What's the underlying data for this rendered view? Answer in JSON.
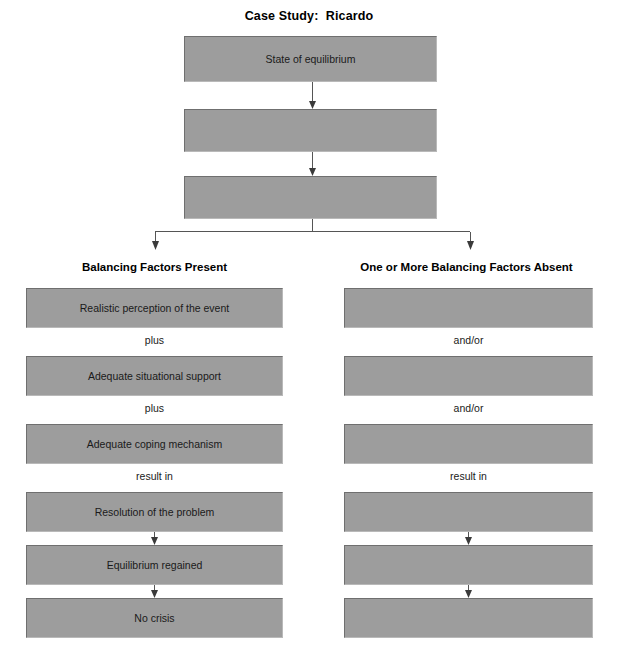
{
  "title": "Case Study:  Ricardo",
  "colors": {
    "box_fill": "#9d9d9d",
    "box_border_dark": "#6f6f6f",
    "box_border_light": "#b9b9b9",
    "line": "#555555",
    "arrow": "#3a3a3a",
    "text": "#1a1a1a",
    "background": "#ffffff"
  },
  "stem": {
    "boxes": [
      {
        "label": "State of equilibrium",
        "blank": false
      },
      {
        "label": "",
        "blank": true
      },
      {
        "label": "",
        "blank": true
      }
    ]
  },
  "columns": [
    {
      "id": "balancing-factors-present",
      "header": "Balancing Factors Present",
      "boxes": [
        {
          "label": "Realistic perception of the event",
          "blank": false
        },
        {
          "label": "Adequate situational support",
          "blank": false
        },
        {
          "label": "Adequate coping mechanism",
          "blank": false
        },
        {
          "label": "Resolution of the problem",
          "blank": false
        },
        {
          "label": "Equilibrium regained",
          "blank": false
        },
        {
          "label": "No crisis",
          "blank": false
        }
      ],
      "connectors": [
        {
          "label": "plus",
          "type": "word"
        },
        {
          "label": "plus",
          "type": "word"
        },
        {
          "label": "result in",
          "type": "word"
        },
        {
          "label": "",
          "type": "arrow"
        },
        {
          "label": "",
          "type": "arrow"
        }
      ]
    },
    {
      "id": "balancing-factors-absent",
      "header": "One or More Balancing Factors Absent",
      "boxes": [
        {
          "label": "",
          "blank": true
        },
        {
          "label": "",
          "blank": true
        },
        {
          "label": "",
          "blank": true
        },
        {
          "label": "",
          "blank": true
        },
        {
          "label": "",
          "blank": true
        },
        {
          "label": "",
          "blank": true
        }
      ],
      "connectors": [
        {
          "label": "and/or",
          "type": "word"
        },
        {
          "label": "and/or",
          "type": "word"
        },
        {
          "label": "result in",
          "type": "word"
        },
        {
          "label": "",
          "type": "arrow"
        },
        {
          "label": "",
          "type": "arrow"
        }
      ]
    }
  ]
}
